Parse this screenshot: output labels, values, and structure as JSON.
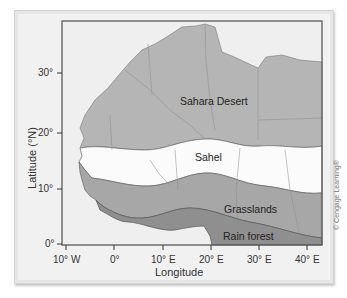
{
  "map": {
    "title": "Vegetation zones of West/North Africa",
    "regions": [
      {
        "label": "Sahara Desert",
        "color": "#b4b4b4"
      },
      {
        "label": "Sahel",
        "color": "#fafafa"
      },
      {
        "label": "Grasslands",
        "color": "#a6a6a6"
      },
      {
        "label": "Rain forest",
        "color": "#8e8e8e"
      }
    ],
    "ocean_color": "#efefef",
    "frame_color": "#5a5a5a"
  },
  "axes": {
    "y_title": "Latitude (°N)",
    "x_title": "Longitude",
    "y_ticks": [
      "30°",
      "20°",
      "10°",
      "0°"
    ],
    "x_ticks": [
      "10° W",
      "0°",
      "10° E",
      "20° E",
      "30° E",
      "40° E"
    ]
  },
  "credit": "© Cengage Learning®"
}
